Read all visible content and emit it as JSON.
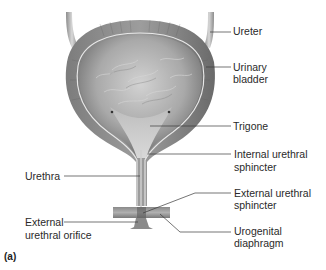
{
  "figure": {
    "panel_label": "(a)",
    "colors": {
      "tissue_dark": "#6f6f6f",
      "tissue_mid": "#9a9a9a",
      "tissue_light": "#c9c9c9",
      "lumen": "#a8a8a8",
      "leader_line": "#3a3a3a",
      "text": "#2a2a2a",
      "background": "#ffffff"
    },
    "labels": {
      "ureter": "Ureter",
      "urinary_bladder_1": "Urinary",
      "urinary_bladder_2": "bladder",
      "trigone": "Trigone",
      "internal_sphincter_1": "Internal urethral",
      "internal_sphincter_2": "sphincter",
      "external_sphincter_1": "External urethral",
      "external_sphincter_2": "sphincter",
      "urogenital_1": "Urogenital",
      "urogenital_2": "diaphragm",
      "urethra": "Urethra",
      "orifice_1": "External",
      "orifice_2": "urethral orifice"
    }
  }
}
